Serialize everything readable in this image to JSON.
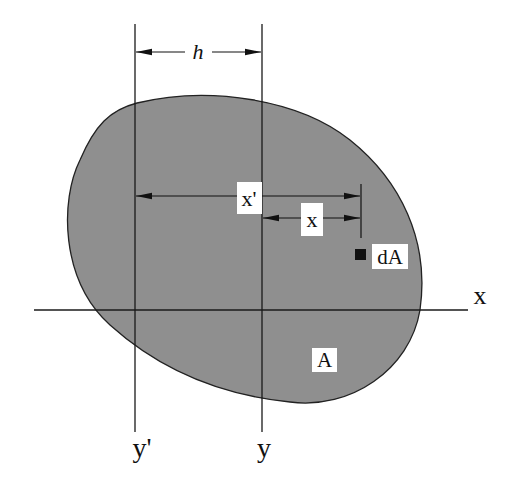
{
  "diagram": {
    "colors": {
      "shape_fill": "#8f8f8f",
      "line": "#1a1a1a",
      "label_bg": "#ffffff",
      "element": "#111111"
    },
    "labels": {
      "h": "h",
      "x_prime": "x'",
      "x_dist": "x",
      "dA": "dA",
      "x_axis": "x",
      "A": "A",
      "y_prime": "y'",
      "y": "y"
    },
    "dimensions": [
      {
        "name": "h",
        "from": "y'",
        "to": "y",
        "description": "distance between axes"
      },
      {
        "name": "x'",
        "from": "y'",
        "to": "dA",
        "description": "distance of dA from y' axis"
      },
      {
        "name": "x",
        "from": "y",
        "to": "dA",
        "description": "distance of dA from y axis"
      }
    ]
  }
}
